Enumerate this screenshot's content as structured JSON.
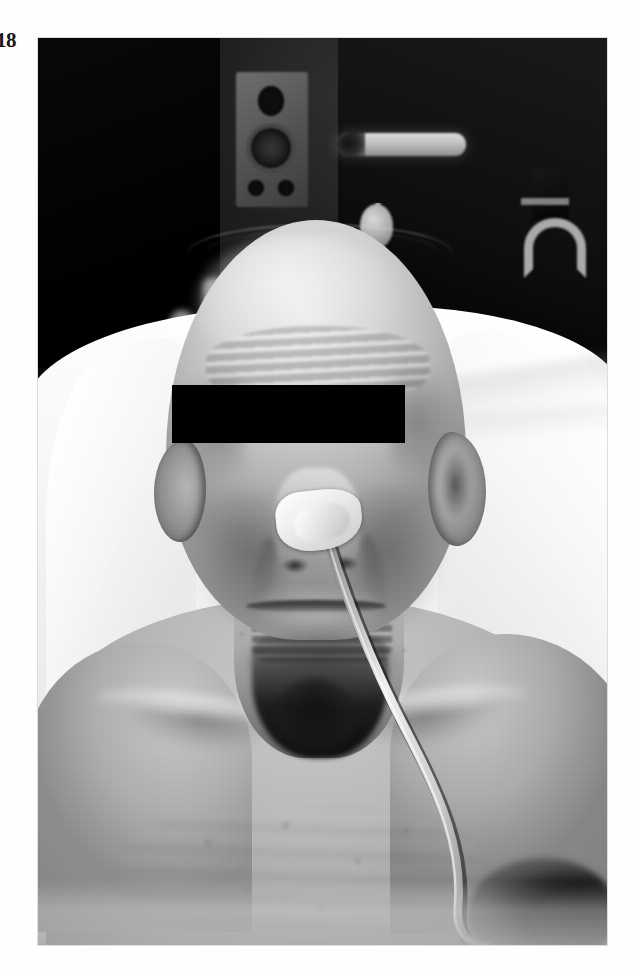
{
  "page": {
    "folio": "18",
    "background_color": "#ffffff"
  },
  "plate": {
    "caption": "",
    "alt": "Clinical photograph of an emaciated elderly male patient lying in a hospital bed, viewed from the front, with a nasogastric feeding tube secured to the nose by white adhesive tape and running down across the chest; a black rectangle masks the eyes for anonymity.",
    "medium": "black-and-white clinical photograph",
    "censor_bar_color": "#000000",
    "border_color": "#d8d8d8"
  },
  "scene": {
    "subject": {
      "name": "patient",
      "description": "elderly emaciated male, bald, temporal wasting, prominent clavicles and ribs"
    },
    "devices": [
      {
        "name": "nasogastric-tube",
        "label": "nasogastric feeding tube"
      },
      {
        "name": "adhesive-tape",
        "label": "adhesive tape fixation on nose"
      }
    ],
    "bedding": {
      "name": "hospital-sheet",
      "label": "white sheet and pillow"
    },
    "background_objects": [
      {
        "name": "speaker",
        "label": "wall-mounted loudspeaker"
      },
      {
        "name": "strip-light",
        "label": "fluorescent strip light"
      },
      {
        "name": "iv-pole",
        "label": "pole-mounted fixture"
      },
      {
        "name": "wall-hook",
        "label": "wall hanger bracket"
      }
    ]
  }
}
